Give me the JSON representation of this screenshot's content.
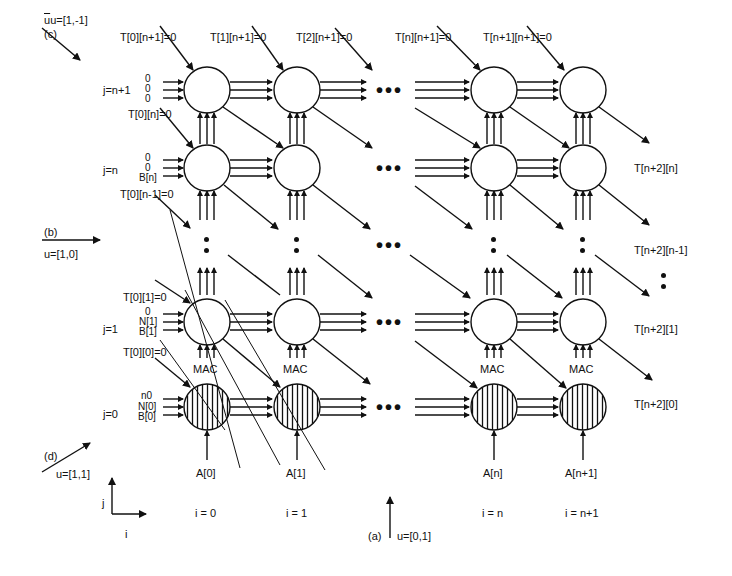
{
  "diagram": {
    "type": "systolic-array-dependence-graph",
    "columns": [
      "i = 0",
      "i = 1",
      "i = n",
      "i = n+1"
    ],
    "rows": [
      "j=n+1",
      "j=n",
      "j=1",
      "j=0"
    ],
    "top_inputs": [
      "T[0][n+1]=0",
      "T[1][n+1]=0",
      "T[2][n+1]=0",
      "T[n][n+1]=0",
      "T[n+1][n+1]=0"
    ],
    "row_left_inputs": {
      "j_n_plus_1": {
        "lines": [
          "0",
          "0",
          "0"
        ],
        "t_label": "T[0][n]=0"
      },
      "j_n": {
        "lines": [
          "0",
          "0",
          "B[n]"
        ],
        "t_label": "T[0][n-1]=0"
      },
      "j_1": {
        "lines": [
          "0",
          "N[1]",
          "B[1]"
        ],
        "t_top_label": "T[0][1]=0",
        "t_label": "T[0][0]=0"
      },
      "j_0": {
        "lines": [
          "n0",
          "N[0]",
          "B[0]"
        ]
      }
    },
    "bottom_inputs": [
      "A[0]",
      "A[1]",
      "A[n]",
      "A[n+1]"
    ],
    "right_outputs": [
      "T[n+2][n]",
      "T[n+2][n-1]",
      "T[n+2][1]",
      "T[n+2][0]"
    ],
    "mac_label": "MAC",
    "directions": {
      "a": {
        "tag": "(a)",
        "vector": "u=[0,1]",
        "sup": "T"
      },
      "b": {
        "tag": "(b)",
        "vector": "u=[1,0]",
        "sup": "T"
      },
      "c": {
        "tag": "(c)",
        "vector": "u=[1,-1]",
        "sup": "T"
      },
      "d": {
        "tag": "(d)",
        "vector": "u=[1,1]",
        "sup": "T"
      }
    },
    "axes": {
      "x": "i",
      "y": "j"
    },
    "ellipsis": "•••"
  }
}
